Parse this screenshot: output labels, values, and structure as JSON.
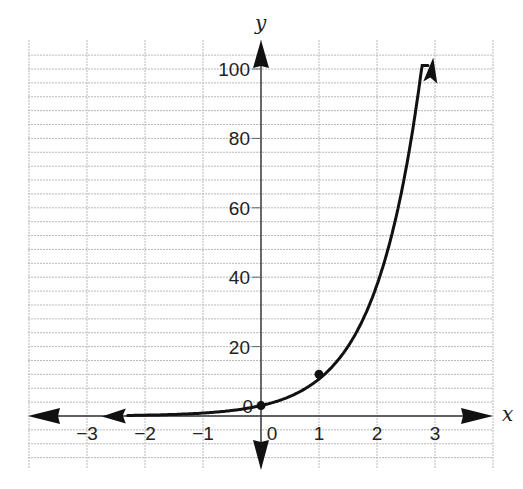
{
  "chart_data": {
    "type": "line",
    "title": "",
    "xlabel": "x",
    "ylabel": "y",
    "xlim": [
      -4,
      4
    ],
    "ylim": [
      -16,
      108
    ],
    "grid": true,
    "x_ticks": [
      -3,
      -2,
      -1,
      0,
      1,
      2,
      3
    ],
    "x_tick_labels": [
      "−3",
      "−2",
      "−1",
      "0",
      "1",
      "2",
      "3"
    ],
    "y_ticks": [
      20,
      40,
      60,
      80,
      100
    ],
    "y_tick_labels": [
      "20",
      "40",
      "60",
      "80",
      "100"
    ],
    "y_minor_step": 4,
    "series": [
      {
        "name": "exponential curve",
        "color": "#111111",
        "x": [
          -2.4,
          -2,
          -1.5,
          -1,
          -0.5,
          0,
          0.5,
          1,
          1.5,
          2,
          2.5,
          2.95
        ],
        "values": [
          0.3,
          0.4,
          0.7,
          1.1,
          1.8,
          3,
          6.5,
          12,
          21,
          38,
          65,
          101
        ],
        "arrows": [
          "left",
          "right"
        ]
      }
    ],
    "marked_points": [
      {
        "x": 0,
        "y": 3
      },
      {
        "x": 1,
        "y": 12
      }
    ]
  }
}
